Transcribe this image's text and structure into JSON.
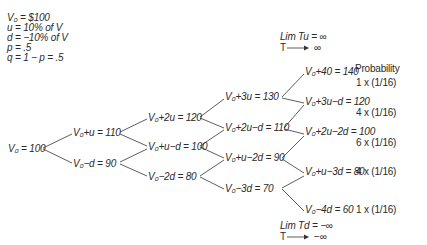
{
  "parameters": [
    {
      "symbol": "V0",
      "text": "V₀ = $100"
    },
    {
      "symbol": "u",
      "text": "u  = 10% of V"
    },
    {
      "symbol": "d",
      "text": "d  = −10% of V"
    },
    {
      "symbol": "p",
      "text": "p  = .5"
    },
    {
      "symbol": "q",
      "text": "q  = 1 − p  =  .5"
    }
  ],
  "limits": {
    "upper_line1": "Lim Tu = ∞",
    "upper_line2": "T ⟶  ∞",
    "lower_line1": "Lim Td = −∞",
    "lower_line2": "T ⟶  −∞"
  },
  "probability_header": "Probability",
  "tree": {
    "level0": [
      "V₀ = 100"
    ],
    "level1": [
      "V₀+u = 110",
      "V₀−d = 90"
    ],
    "level2": [
      "V₀+2u = 120",
      "V₀+u−d = 100",
      "V₀−2d = 80"
    ],
    "level3": [
      "V₀+3u = 130",
      "V₀+2u−d = 110",
      "V₀+u−2d = 90",
      "V₀−3d = 70"
    ],
    "level4": [
      "V₀+40 = 140",
      "V₀+3u−d = 120",
      "V₀+2u−2d = 100",
      "V₀+u−3d = 80",
      "V₀−4d = 60"
    ]
  },
  "probabilities": [
    "1 x (1/16)",
    "4 x (1/16)",
    "6 x (1/16)",
    "4 x (1/16)",
    "1 x (1/16)"
  ]
}
